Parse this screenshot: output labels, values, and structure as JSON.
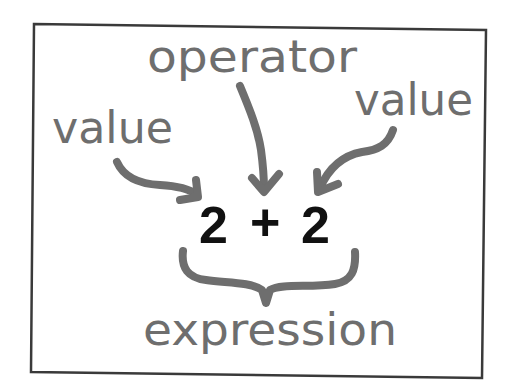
{
  "diagram": {
    "labels": {
      "operator": "operator",
      "value_left": "value",
      "value_right": "value",
      "expression": "expression"
    },
    "expression": {
      "left_operand": "2",
      "operator": "+",
      "right_operand": "2"
    },
    "colors": {
      "annotation": "#6e6e6e",
      "expression_text": "#111111",
      "frame": "#3a3a3a",
      "background": "#ffffff"
    }
  }
}
